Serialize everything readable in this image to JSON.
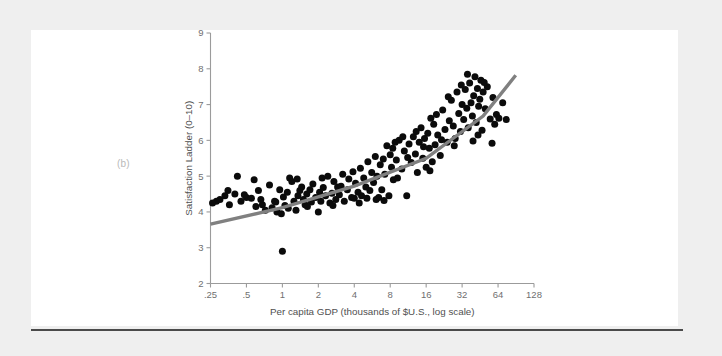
{
  "page": {
    "background_color": "#efefef",
    "card_color": "#ffffff",
    "rule_color": "#4a4a4a"
  },
  "panel": {
    "label": "(b)"
  },
  "chart_data": {
    "type": "scatter",
    "title": "",
    "xlabel": "Per capita GDP (thousands of $U.S., log scale)",
    "ylabel": "Satisfaction Ladder (0–10)",
    "grid": false,
    "legend": null,
    "point_color": "#0b0b0b",
    "trend_color": "#808080",
    "axis_color": "#9b9b9b",
    "x_scale": "log2",
    "x_tick_labels": [
      ".25",
      ".5",
      "1",
      "2",
      "4",
      "8",
      "16",
      "32",
      "64",
      "128"
    ],
    "x_tick_values": [
      0.25,
      0.5,
      1,
      2,
      4,
      8,
      16,
      32,
      64,
      128
    ],
    "xlim": [
      0.25,
      128
    ],
    "y_tick_labels": [
      "2",
      "3",
      "4",
      "5",
      "6",
      "7",
      "8",
      "9"
    ],
    "y_tick_values": [
      2,
      3,
      4,
      5,
      6,
      7,
      8,
      9
    ],
    "ylim": [
      2,
      9
    ],
    "trend_line": {
      "x": [
        0.25,
        1,
        4,
        16,
        48,
        90
      ],
      "y": [
        3.66,
        4.12,
        4.72,
        5.5,
        6.68,
        7.82
      ]
    },
    "points": [
      [
        0.28,
        4.3
      ],
      [
        0.3,
        4.35
      ],
      [
        0.33,
        4.45
      ],
      [
        0.36,
        4.2
      ],
      [
        0.4,
        4.5
      ],
      [
        0.42,
        5.0
      ],
      [
        0.45,
        4.3
      ],
      [
        0.5,
        4.4
      ],
      [
        0.55,
        4.38
      ],
      [
        0.58,
        4.9
      ],
      [
        0.6,
        4.15
      ],
      [
        0.63,
        4.6
      ],
      [
        0.68,
        4.2
      ],
      [
        0.72,
        4.05
      ],
      [
        0.78,
        4.75
      ],
      [
        0.82,
        4.12
      ],
      [
        0.86,
        4.3
      ],
      [
        0.9,
        4.0
      ],
      [
        0.95,
        4.62
      ],
      [
        0.98,
        3.95
      ],
      [
        1.0,
        2.9
      ],
      [
        1.02,
        4.42
      ],
      [
        1.05,
        4.18
      ],
      [
        1.1,
        4.55
      ],
      [
        1.15,
        4.95
      ],
      [
        1.2,
        4.85
      ],
      [
        1.25,
        4.3
      ],
      [
        1.3,
        4.05
      ],
      [
        1.35,
        4.45
      ],
      [
        1.4,
        4.6
      ],
      [
        1.45,
        4.7
      ],
      [
        1.5,
        4.35
      ],
      [
        1.55,
        4.2
      ],
      [
        1.6,
        4.5
      ],
      [
        1.7,
        4.62
      ],
      [
        1.75,
        4.28
      ],
      [
        1.8,
        4.78
      ],
      [
        1.9,
        4.4
      ],
      [
        2.0,
        4.0
      ],
      [
        2.05,
        4.55
      ],
      [
        2.1,
        4.3
      ],
      [
        2.2,
        4.68
      ],
      [
        2.3,
        4.45
      ],
      [
        2.4,
        5.0
      ],
      [
        2.5,
        4.25
      ],
      [
        2.6,
        4.52
      ],
      [
        2.7,
        4.85
      ],
      [
        2.8,
        4.35
      ],
      [
        2.9,
        4.7
      ],
      [
        3.0,
        4.48
      ],
      [
        3.2,
        5.05
      ],
      [
        3.3,
        4.3
      ],
      [
        3.5,
        4.62
      ],
      [
        3.6,
        4.92
      ],
      [
        3.8,
        4.4
      ],
      [
        4.0,
        4.38
      ],
      [
        4.1,
        4.8
      ],
      [
        4.3,
        4.55
      ],
      [
        4.5,
        5.22
      ],
      [
        4.6,
        4.45
      ],
      [
        4.8,
        4.95
      ],
      [
        5.0,
        4.7
      ],
      [
        5.2,
        5.4
      ],
      [
        5.4,
        4.6
      ],
      [
        5.6,
        5.1
      ],
      [
        5.8,
        4.82
      ],
      [
        6.0,
        5.55
      ],
      [
        6.2,
        5.0
      ],
      [
        6.4,
        4.4
      ],
      [
        6.6,
        5.32
      ],
      [
        6.8,
        4.62
      ],
      [
        7.0,
        5.48
      ],
      [
        7.2,
        5.05
      ],
      [
        7.5,
        5.85
      ],
      [
        7.8,
        4.45
      ],
      [
        8.0,
        5.6
      ],
      [
        8.2,
        5.25
      ],
      [
        8.5,
        4.9
      ],
      [
        8.8,
        5.95
      ],
      [
        9.0,
        5.45
      ],
      [
        9.5,
        6.0
      ],
      [
        10.0,
        5.2
      ],
      [
        10.5,
        5.7
      ],
      [
        11.0,
        4.45
      ],
      [
        11.5,
        5.9
      ],
      [
        12.0,
        5.38
      ],
      [
        12.5,
        6.1
      ],
      [
        13.0,
        5.62
      ],
      [
        13.5,
        5.1
      ],
      [
        14.0,
        5.95
      ],
      [
        14.5,
        6.35
      ],
      [
        15.0,
        5.5
      ],
      [
        15.5,
        6.05
      ],
      [
        16.0,
        5.25
      ],
      [
        16.5,
        6.2
      ],
      [
        17.0,
        5.78
      ],
      [
        17.5,
        6.62
      ],
      [
        18.0,
        5.4
      ],
      [
        18.5,
        6.45
      ],
      [
        19.0,
        5.88
      ],
      [
        20.0,
        6.15
      ],
      [
        21.0,
        5.58
      ],
      [
        22.0,
        6.85
      ],
      [
        23.0,
        6.3
      ],
      [
        24.0,
        5.95
      ],
      [
        25.0,
        6.55
      ],
      [
        26.0,
        7.12
      ],
      [
        27.0,
        6.4
      ],
      [
        28.0,
        6.05
      ],
      [
        29.0,
        7.35
      ],
      [
        30.0,
        6.75
      ],
      [
        31.0,
        6.25
      ],
      [
        32.0,
        7.0
      ],
      [
        33.0,
        6.58
      ],
      [
        34.0,
        7.42
      ],
      [
        35.0,
        6.9
      ],
      [
        36.0,
        6.35
      ],
      [
        37.0,
        7.6
      ],
      [
        38.0,
        7.05
      ],
      [
        39.0,
        6.68
      ],
      [
        40.0,
        7.25
      ],
      [
        41.0,
        7.78
      ],
      [
        42.0,
        6.5
      ],
      [
        43.0,
        7.45
      ],
      [
        44.0,
        6.95
      ],
      [
        45.0,
        7.15
      ],
      [
        46.0,
        7.68
      ],
      [
        47.0,
        6.28
      ],
      [
        48.0,
        7.35
      ],
      [
        50.0,
        6.88
      ],
      [
        52.0,
        7.5
      ],
      [
        55.0,
        6.6
      ],
      [
        58.0,
        7.2
      ],
      [
        60.0,
        6.45
      ],
      [
        62.0,
        6.72
      ],
      [
        65.0,
        6.62
      ],
      [
        70.0,
        7.05
      ],
      [
        75.0,
        6.58
      ],
      [
        0.26,
        4.25
      ],
      [
        0.35,
        4.6
      ],
      [
        0.48,
        4.48
      ],
      [
        0.66,
        4.35
      ],
      [
        0.88,
        4.28
      ],
      [
        1.12,
        4.1
      ],
      [
        1.33,
        4.92
      ],
      [
        1.62,
        4.15
      ],
      [
        2.15,
        4.95
      ],
      [
        2.65,
        4.18
      ],
      [
        3.1,
        4.72
      ],
      [
        3.9,
        5.12
      ],
      [
        4.4,
        4.25
      ],
      [
        5.1,
        4.38
      ],
      [
        6.1,
        4.35
      ],
      [
        7.1,
        4.32
      ],
      [
        8.4,
        5.78
      ],
      [
        9.2,
        4.95
      ],
      [
        10.2,
        6.1
      ],
      [
        11.2,
        5.52
      ],
      [
        13.2,
        6.25
      ],
      [
        15.2,
        5.82
      ],
      [
        17.2,
        5.15
      ],
      [
        19.5,
        6.72
      ],
      [
        21.5,
        6.02
      ],
      [
        24.5,
        7.22
      ],
      [
        27.5,
        5.85
      ],
      [
        31.5,
        7.55
      ],
      [
        35.5,
        7.85
      ],
      [
        39.5,
        5.98
      ],
      [
        43.5,
        6.15
      ],
      [
        49.0,
        7.62
      ],
      [
        57.0,
        5.92
      ]
    ]
  }
}
